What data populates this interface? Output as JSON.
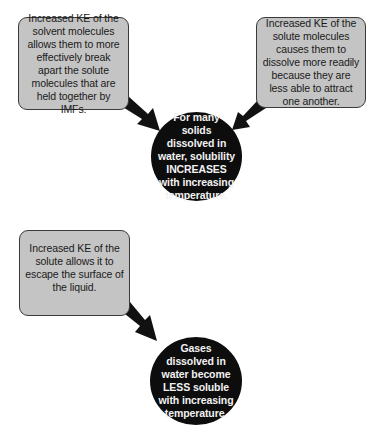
{
  "diagram": {
    "section_solids": {
      "box_left": "Increased KE of the solvent molecules allows them to more effectively break apart the solute molecules that are held together by IMFs.",
      "box_right": "Increased KE of the solute molecules causes them to dissolve more readily because they are less able to attract one another.",
      "conclusion": "For many solids dissolved in water, solubility INCREASES with increasing temperature."
    },
    "section_gases": {
      "box_left": "Increased KE of the solute allows it to escape the surface of the liquid.",
      "conclusion": "Gases dissolved in water become LESS soluble with increasing temperature."
    },
    "colors": {
      "box_fill": "#c4c4c4",
      "box_border": "#3a3a3a",
      "circle_fill": "#0d0d0d",
      "circle_text": "#f2f2f2",
      "arrow": "#111111"
    }
  }
}
